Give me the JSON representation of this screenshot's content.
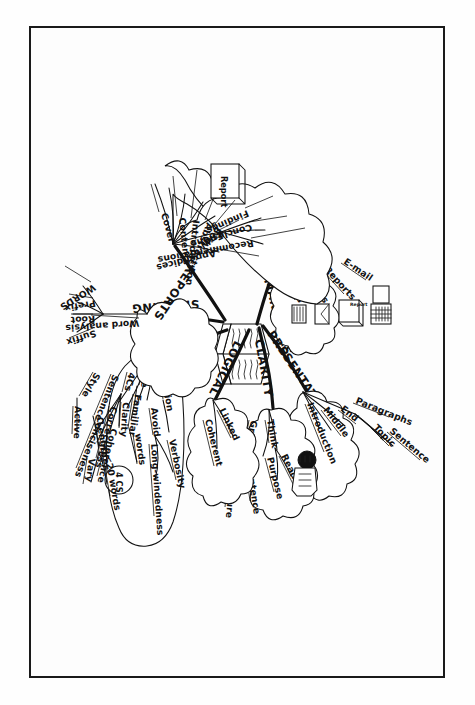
{
  "document": {
    "type": "hand-drawn mind map",
    "title": "Business Writing Mind Map",
    "center_icon": "open-book-icon",
    "background_color": "#fdfdfd",
    "ink_color": "#111111",
    "frame": {
      "border_color": "#1a1a1a"
    }
  },
  "branches": [
    {
      "id": "managers",
      "label": "MANAGERS",
      "children": [
        {
          "label": "Memos",
          "icon": "memo-icon"
        },
        {
          "label": "Letters",
          "icon": "envelope-icon"
        },
        {
          "label": "Reports",
          "icon": "report-book-icon"
        },
        {
          "label": "E-mail",
          "icon": "computer-icon"
        }
      ]
    },
    {
      "id": "presentation",
      "label": "PRESENTATION",
      "children": [
        {
          "label": "Introduction"
        },
        {
          "label": "Middle"
        },
        {
          "label": "End"
        },
        {
          "label": "Paragraphs",
          "children": [
            {
              "label": "Topic"
            },
            {
              "label": "Sentence"
            }
          ]
        }
      ]
    },
    {
      "id": "clarity",
      "label": "CLARITY",
      "children": [
        {
          "label": "Think",
          "children": [
            {
              "label": "Reader"
            },
            {
              "label": "Purpose"
            }
          ]
        },
        {
          "label": "Grammar",
          "children": [
            {
              "label": "Sentence"
            },
            {
              "label": "Structure"
            }
          ]
        }
      ]
    },
    {
      "id": "logical",
      "label": "LOGICAL",
      "children": [
        {
          "label": "Linked"
        },
        {
          "label": "Coherent"
        }
      ]
    },
    {
      "id": "concise",
      "label": "CONCISE",
      "children": [
        {
          "label": "Precision",
          "children": [
            {
              "label": "Avoid",
              "children": [
                {
                  "label": "Verbosity"
                },
                {
                  "label": "Long-windedness"
                }
              ]
            }
          ]
        },
        {
          "label": "Use",
          "children": [
            {
              "label": "Familiar"
            },
            {
              "label": "words"
            }
          ]
        },
        {
          "label": "4Cs",
          "badge": "4 CS",
          "children": [
            {
              "label": "Clarity"
            },
            {
              "label": "Correctness"
            },
            {
              "label": "Conciseness"
            },
            {
              "label": "Coherence"
            }
          ]
        },
        {
          "label": "Sentence",
          "children": [
            {
              "label": "Length",
              "children": [
                {
                  "label": "<20 words"
                },
                {
                  "label": "Vary"
                }
              ]
            }
          ]
        },
        {
          "label": "Style",
          "children": [
            {
              "label": "Active"
            }
          ]
        }
      ]
    },
    {
      "id": "spelling",
      "label": "SPELLING",
      "children": [
        {
          "label": "Word analysis",
          "children": [
            {
              "label": "WORDS"
            },
            {
              "label": "Prefix"
            },
            {
              "label": "Root"
            },
            {
              "label": "Suffix"
            }
          ]
        }
      ]
    },
    {
      "id": "reports",
      "label": "REPORTS",
      "icon": "report-book-icon",
      "children": [
        {
          "label": "Cover"
        },
        {
          "label": "Contents"
        },
        {
          "label": "Introduction"
        },
        {
          "label": "Abstract"
        },
        {
          "label": "Body"
        },
        {
          "label": "End",
          "children": [
            {
              "label": "Findings"
            },
            {
              "label": "Conclusions"
            },
            {
              "label": "Recommendations"
            }
          ]
        },
        {
          "label": "Appendices"
        }
      ]
    }
  ],
  "labels": {
    "managers": "MANAGERS",
    "presentation": "PRESENTATION",
    "clarity": "CLARITY",
    "logical": "LOGICAL",
    "concise": "CONCISE",
    "spelling": "SPELLING",
    "reports": "REPORTS",
    "memos": "Memos",
    "letters": "Letters",
    "reports_item": "Reports",
    "email": "E-mail",
    "introduction": "Introduction",
    "middle": "Middle",
    "end": "End",
    "paragraphs": "Paragraphs",
    "topic": "Topic",
    "sentence": "Sentence",
    "think": "Think",
    "reader": "Reader",
    "purpose": "Purpose",
    "grammar": "Grammar",
    "sentence2": "Sentence",
    "structure": "Structure",
    "linked": "Linked",
    "coherent": "Coherent",
    "precision": "Precision",
    "avoid": "Avoid",
    "verbosity": "Verbosity",
    "longwinded": "Long-windedness",
    "use": "Use",
    "familiar": "Familiar",
    "words": "words",
    "fourcs": "4Cs",
    "fourcs_badge": "4 CS",
    "clarity_c": "Clarity",
    "correctness": "Correctness",
    "conciseness": "Conciseness",
    "coherence": "Coherence",
    "sentence3": "Sentence",
    "length": "Length",
    "twenty": "<20 words",
    "vary": "Vary",
    "style": "Style",
    "active": "Active",
    "wordanalysis": "Word analysis",
    "wordsbig": "WORDS",
    "prefix": "Prefix",
    "root": "Root",
    "suffix": "Suffix",
    "cover": "Cover",
    "contents": "Contents",
    "introduction2": "Introduction",
    "abstract": "Abstract",
    "body": "Body",
    "end2": "End",
    "findings": "Findings",
    "conclusions": "Conclusions",
    "recommendations": "Recommendations",
    "appendices": "Appendices",
    "report_icon_text": "Report",
    "report_icon_text2": "Report"
  }
}
